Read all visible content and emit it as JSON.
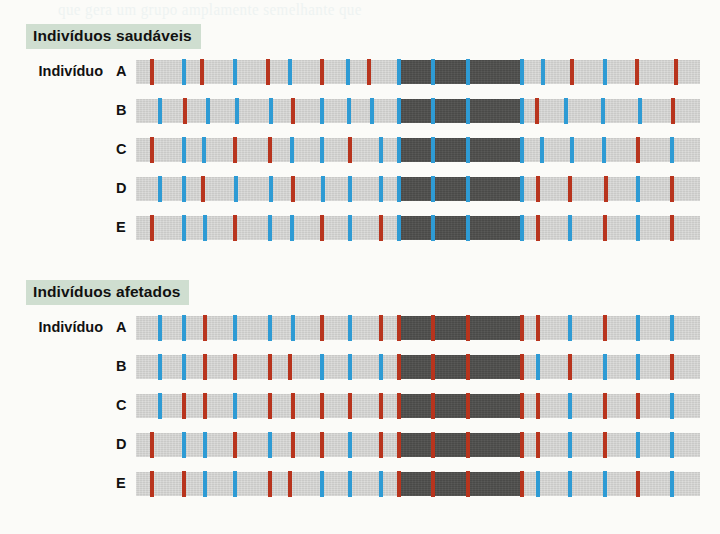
{
  "bleed_through_text": "que gera um grupo amplamente semelhante que",
  "figure": {
    "bar": {
      "width": 564,
      "left": 136
    },
    "groups": [
      {
        "id": "healthy",
        "badge_label": "Indivíduos saudáveis",
        "badge_color": "#cfded0",
        "rows": [
          {
            "label_word": "Indivíduo",
            "letter": "A",
            "haplotypes": [
              [
                261,
                127
              ]
            ],
            "ticks": [
              {
                "x": 14,
                "c": "red"
              },
              {
                "x": 46,
                "c": "blue"
              },
              {
                "x": 64,
                "c": "red"
              },
              {
                "x": 97,
                "c": "blue"
              },
              {
                "x": 130,
                "c": "red"
              },
              {
                "x": 152,
                "c": "blue"
              },
              {
                "x": 184,
                "c": "red"
              },
              {
                "x": 210,
                "c": "blue"
              },
              {
                "x": 231,
                "c": "red"
              },
              {
                "x": 261,
                "c": "blue"
              },
              {
                "x": 295,
                "c": "blue"
              },
              {
                "x": 330,
                "c": "blue"
              },
              {
                "x": 384,
                "c": "blue"
              },
              {
                "x": 405,
                "c": "blue"
              },
              {
                "x": 434,
                "c": "red"
              },
              {
                "x": 467,
                "c": "blue"
              },
              {
                "x": 499,
                "c": "red"
              },
              {
                "x": 538,
                "c": "red"
              }
            ]
          },
          {
            "letter": "B",
            "haplotypes": [
              [
                261,
                127
              ]
            ],
            "ticks": [
              {
                "x": 22,
                "c": "blue"
              },
              {
                "x": 47,
                "c": "red"
              },
              {
                "x": 70,
                "c": "blue"
              },
              {
                "x": 99,
                "c": "blue"
              },
              {
                "x": 133,
                "c": "blue"
              },
              {
                "x": 155,
                "c": "red"
              },
              {
                "x": 184,
                "c": "blue"
              },
              {
                "x": 211,
                "c": "blue"
              },
              {
                "x": 234,
                "c": "blue"
              },
              {
                "x": 261,
                "c": "blue"
              },
              {
                "x": 295,
                "c": "blue"
              },
              {
                "x": 330,
                "c": "blue"
              },
              {
                "x": 384,
                "c": "blue"
              },
              {
                "x": 399,
                "c": "red"
              },
              {
                "x": 428,
                "c": "blue"
              },
              {
                "x": 465,
                "c": "blue"
              },
              {
                "x": 502,
                "c": "blue"
              },
              {
                "x": 535,
                "c": "red"
              }
            ]
          },
          {
            "letter": "C",
            "haplotypes": [
              [
                261,
                127
              ]
            ],
            "ticks": [
              {
                "x": 14,
                "c": "red"
              },
              {
                "x": 46,
                "c": "blue"
              },
              {
                "x": 66,
                "c": "blue"
              },
              {
                "x": 97,
                "c": "red"
              },
              {
                "x": 132,
                "c": "red"
              },
              {
                "x": 154,
                "c": "blue"
              },
              {
                "x": 184,
                "c": "blue"
              },
              {
                "x": 212,
                "c": "red"
              },
              {
                "x": 243,
                "c": "blue"
              },
              {
                "x": 261,
                "c": "blue"
              },
              {
                "x": 295,
                "c": "blue"
              },
              {
                "x": 330,
                "c": "blue"
              },
              {
                "x": 384,
                "c": "blue"
              },
              {
                "x": 404,
                "c": "blue"
              },
              {
                "x": 434,
                "c": "blue"
              },
              {
                "x": 466,
                "c": "blue"
              },
              {
                "x": 500,
                "c": "red"
              },
              {
                "x": 534,
                "c": "blue"
              }
            ]
          },
          {
            "letter": "D",
            "haplotypes": [
              [
                261,
                127
              ]
            ],
            "ticks": [
              {
                "x": 22,
                "c": "blue"
              },
              {
                "x": 46,
                "c": "blue"
              },
              {
                "x": 65,
                "c": "red"
              },
              {
                "x": 98,
                "c": "blue"
              },
              {
                "x": 133,
                "c": "blue"
              },
              {
                "x": 155,
                "c": "red"
              },
              {
                "x": 185,
                "c": "blue"
              },
              {
                "x": 212,
                "c": "blue"
              },
              {
                "x": 243,
                "c": "blue"
              },
              {
                "x": 261,
                "c": "blue"
              },
              {
                "x": 295,
                "c": "blue"
              },
              {
                "x": 330,
                "c": "blue"
              },
              {
                "x": 384,
                "c": "blue"
              },
              {
                "x": 400,
                "c": "red"
              },
              {
                "x": 432,
                "c": "red"
              },
              {
                "x": 468,
                "c": "red"
              },
              {
                "x": 500,
                "c": "blue"
              },
              {
                "x": 534,
                "c": "red"
              }
            ]
          },
          {
            "letter": "E",
            "haplotypes": [
              [
                261,
                127
              ]
            ],
            "ticks": [
              {
                "x": 14,
                "c": "red"
              },
              {
                "x": 46,
                "c": "blue"
              },
              {
                "x": 67,
                "c": "blue"
              },
              {
                "x": 97,
                "c": "red"
              },
              {
                "x": 132,
                "c": "blue"
              },
              {
                "x": 154,
                "c": "blue"
              },
              {
                "x": 184,
                "c": "red"
              },
              {
                "x": 212,
                "c": "blue"
              },
              {
                "x": 243,
                "c": "red"
              },
              {
                "x": 261,
                "c": "blue"
              },
              {
                "x": 295,
                "c": "blue"
              },
              {
                "x": 330,
                "c": "blue"
              },
              {
                "x": 384,
                "c": "blue"
              },
              {
                "x": 400,
                "c": "red"
              },
              {
                "x": 432,
                "c": "blue"
              },
              {
                "x": 467,
                "c": "red"
              },
              {
                "x": 500,
                "c": "blue"
              },
              {
                "x": 534,
                "c": "red"
              }
            ]
          }
        ]
      },
      {
        "id": "affected",
        "badge_label": "Indivíduos afetados",
        "badge_color": "#cfded0",
        "rows": [
          {
            "label_word": "Indivíduo",
            "letter": "A",
            "haplotypes": [
              [
                261,
                127
              ]
            ],
            "ticks": [
              {
                "x": 22,
                "c": "blue"
              },
              {
                "x": 46,
                "c": "blue"
              },
              {
                "x": 67,
                "c": "red"
              },
              {
                "x": 97,
                "c": "blue"
              },
              {
                "x": 132,
                "c": "blue"
              },
              {
                "x": 155,
                "c": "blue"
              },
              {
                "x": 184,
                "c": "red"
              },
              {
                "x": 212,
                "c": "blue"
              },
              {
                "x": 243,
                "c": "red"
              },
              {
                "x": 261,
                "c": "red"
              },
              {
                "x": 295,
                "c": "red"
              },
              {
                "x": 330,
                "c": "red"
              },
              {
                "x": 384,
                "c": "red"
              },
              {
                "x": 400,
                "c": "red"
              },
              {
                "x": 432,
                "c": "blue"
              },
              {
                "x": 467,
                "c": "red"
              },
              {
                "x": 500,
                "c": "blue"
              },
              {
                "x": 534,
                "c": "blue"
              }
            ]
          },
          {
            "letter": "B",
            "haplotypes": [
              [
                261,
                127
              ]
            ],
            "ticks": [
              {
                "x": 22,
                "c": "blue"
              },
              {
                "x": 46,
                "c": "blue"
              },
              {
                "x": 67,
                "c": "red"
              },
              {
                "x": 97,
                "c": "red"
              },
              {
                "x": 132,
                "c": "red"
              },
              {
                "x": 152,
                "c": "red"
              },
              {
                "x": 184,
                "c": "blue"
              },
              {
                "x": 212,
                "c": "blue"
              },
              {
                "x": 243,
                "c": "blue"
              },
              {
                "x": 261,
                "c": "red"
              },
              {
                "x": 295,
                "c": "red"
              },
              {
                "x": 330,
                "c": "red"
              },
              {
                "x": 384,
                "c": "red"
              },
              {
                "x": 400,
                "c": "blue"
              },
              {
                "x": 432,
                "c": "red"
              },
              {
                "x": 467,
                "c": "blue"
              },
              {
                "x": 500,
                "c": "blue"
              },
              {
                "x": 534,
                "c": "red"
              }
            ]
          },
          {
            "letter": "C",
            "haplotypes": [
              [
                261,
                127
              ]
            ],
            "ticks": [
              {
                "x": 22,
                "c": "blue"
              },
              {
                "x": 46,
                "c": "red"
              },
              {
                "x": 67,
                "c": "red"
              },
              {
                "x": 97,
                "c": "blue"
              },
              {
                "x": 132,
                "c": "red"
              },
              {
                "x": 155,
                "c": "red"
              },
              {
                "x": 184,
                "c": "red"
              },
              {
                "x": 212,
                "c": "red"
              },
              {
                "x": 243,
                "c": "red"
              },
              {
                "x": 261,
                "c": "red"
              },
              {
                "x": 295,
                "c": "red"
              },
              {
                "x": 330,
                "c": "red"
              },
              {
                "x": 384,
                "c": "red"
              },
              {
                "x": 400,
                "c": "red"
              },
              {
                "x": 432,
                "c": "blue"
              },
              {
                "x": 467,
                "c": "red"
              },
              {
                "x": 500,
                "c": "red"
              },
              {
                "x": 534,
                "c": "blue"
              }
            ]
          },
          {
            "letter": "D",
            "haplotypes": [
              [
                261,
                127
              ]
            ],
            "ticks": [
              {
                "x": 14,
                "c": "red"
              },
              {
                "x": 46,
                "c": "blue"
              },
              {
                "x": 67,
                "c": "blue"
              },
              {
                "x": 97,
                "c": "red"
              },
              {
                "x": 132,
                "c": "blue"
              },
              {
                "x": 155,
                "c": "red"
              },
              {
                "x": 184,
                "c": "red"
              },
              {
                "x": 212,
                "c": "blue"
              },
              {
                "x": 243,
                "c": "red"
              },
              {
                "x": 261,
                "c": "red"
              },
              {
                "x": 295,
                "c": "red"
              },
              {
                "x": 330,
                "c": "red"
              },
              {
                "x": 384,
                "c": "red"
              },
              {
                "x": 400,
                "c": "red"
              },
              {
                "x": 432,
                "c": "blue"
              },
              {
                "x": 467,
                "c": "red"
              },
              {
                "x": 500,
                "c": "blue"
              },
              {
                "x": 534,
                "c": "blue"
              }
            ]
          },
          {
            "letter": "E",
            "haplotypes": [
              [
                261,
                127
              ]
            ],
            "ticks": [
              {
                "x": 14,
                "c": "red"
              },
              {
                "x": 46,
                "c": "red"
              },
              {
                "x": 67,
                "c": "blue"
              },
              {
                "x": 97,
                "c": "blue"
              },
              {
                "x": 132,
                "c": "red"
              },
              {
                "x": 152,
                "c": "red"
              },
              {
                "x": 184,
                "c": "blue"
              },
              {
                "x": 212,
                "c": "blue"
              },
              {
                "x": 243,
                "c": "blue"
              },
              {
                "x": 261,
                "c": "red"
              },
              {
                "x": 295,
                "c": "red"
              },
              {
                "x": 330,
                "c": "red"
              },
              {
                "x": 384,
                "c": "red"
              },
              {
                "x": 400,
                "c": "blue"
              },
              {
                "x": 432,
                "c": "blue"
              },
              {
                "x": 467,
                "c": "blue"
              },
              {
                "x": 500,
                "c": "red"
              },
              {
                "x": 534,
                "c": "blue"
              }
            ]
          }
        ]
      }
    ]
  },
  "colors": {
    "bar_background": "#c9c9c7",
    "shared_haplotype": "#4a4a48",
    "marker_red": "#b8341d",
    "marker_blue": "#2e9bd4",
    "badge_green": "#cfded0"
  }
}
